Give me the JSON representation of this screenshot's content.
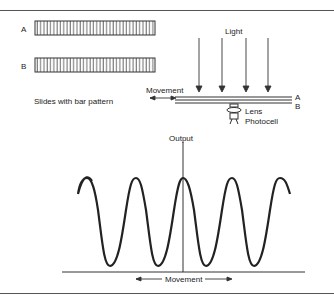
{
  "figure": {
    "slides": {
      "label_a": "A",
      "label_b": "B",
      "caption": "Slides with bar pattern",
      "bar_count": 36
    },
    "setup": {
      "light_label": "Light",
      "movement_label": "Movement",
      "label_a": "A",
      "label_b": "B",
      "lens_label": "Lens",
      "photocell_label": "Photocell",
      "arrow_count": 4
    },
    "graph": {
      "y_axis_label": "Output",
      "x_axis_label": "Movement",
      "waveform": "sinusoidal",
      "peaks": 5
    }
  }
}
